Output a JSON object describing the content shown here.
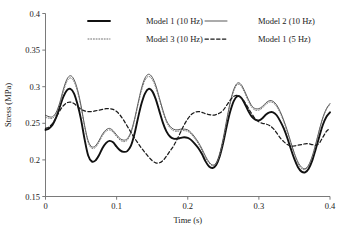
{
  "chart_data": {
    "type": "line",
    "title": "",
    "xlabel": "Time (s)",
    "ylabel": "Stress (MPa)",
    "xlim": [
      0,
      0.4
    ],
    "ylim": [
      0.15,
      0.4
    ],
    "xticks": [
      "0",
      "0.1",
      "0.2",
      "0.3",
      "0.4"
    ],
    "xtick_values": [
      0,
      0.1,
      0.2,
      0.3,
      0.4
    ],
    "yticks": [
      "0.15",
      "0.2",
      "0.25",
      "0.3",
      "0.35",
      "0.4"
    ],
    "ytick_values": [
      0.15,
      0.2,
      0.25,
      0.3,
      0.35,
      0.4
    ],
    "grid": false,
    "legend_position": "top-inside",
    "x": [
      0,
      0.005,
      0.01,
      0.015,
      0.02,
      0.025,
      0.03,
      0.035,
      0.04,
      0.045,
      0.05,
      0.055,
      0.06,
      0.065,
      0.07,
      0.075,
      0.08,
      0.085,
      0.09,
      0.095,
      0.1,
      0.105,
      0.11,
      0.115,
      0.12,
      0.125,
      0.13,
      0.135,
      0.14,
      0.145,
      0.15,
      0.155,
      0.16,
      0.165,
      0.17,
      0.175,
      0.18,
      0.185,
      0.19,
      0.195,
      0.2,
      0.205,
      0.21,
      0.215,
      0.22,
      0.225,
      0.23,
      0.235,
      0.24,
      0.245,
      0.25,
      0.255,
      0.26,
      0.265,
      0.27,
      0.275,
      0.28,
      0.285,
      0.29,
      0.295,
      0.3,
      0.305,
      0.31,
      0.315,
      0.32,
      0.325,
      0.33,
      0.335,
      0.34,
      0.345,
      0.35,
      0.355,
      0.36,
      0.365,
      0.37,
      0.375,
      0.38,
      0.385,
      0.39,
      0.395,
      0.4
    ],
    "series": [
      {
        "name": "Model 1 (10 Hz)",
        "style": "solid-thick",
        "color": "#111111",
        "width": 1.9,
        "values": [
          0.241,
          0.243,
          0.248,
          0.258,
          0.272,
          0.286,
          0.295,
          0.297,
          0.291,
          0.276,
          0.255,
          0.228,
          0.206,
          0.198,
          0.199,
          0.206,
          0.216,
          0.223,
          0.226,
          0.224,
          0.218,
          0.213,
          0.211,
          0.212,
          0.219,
          0.235,
          0.257,
          0.277,
          0.291,
          0.297,
          0.294,
          0.283,
          0.267,
          0.251,
          0.239,
          0.232,
          0.229,
          0.229,
          0.23,
          0.231,
          0.23,
          0.227,
          0.222,
          0.216,
          0.208,
          0.198,
          0.191,
          0.189,
          0.193,
          0.205,
          0.224,
          0.247,
          0.267,
          0.281,
          0.287,
          0.285,
          0.277,
          0.267,
          0.259,
          0.255,
          0.254,
          0.257,
          0.262,
          0.265,
          0.265,
          0.261,
          0.253,
          0.243,
          0.23,
          0.215,
          0.201,
          0.19,
          0.184,
          0.183,
          0.188,
          0.199,
          0.215,
          0.232,
          0.248,
          0.259,
          0.265
        ]
      },
      {
        "name": "Model 2 (10 Hz)",
        "style": "solid-thin",
        "color": "#3a3a3a",
        "width": 0.85,
        "values": [
          0.261,
          0.259,
          0.259,
          0.265,
          0.278,
          0.296,
          0.31,
          0.315,
          0.31,
          0.296,
          0.274,
          0.247,
          0.226,
          0.218,
          0.219,
          0.226,
          0.235,
          0.241,
          0.243,
          0.24,
          0.234,
          0.229,
          0.227,
          0.229,
          0.238,
          0.255,
          0.277,
          0.298,
          0.312,
          0.317,
          0.313,
          0.302,
          0.285,
          0.268,
          0.254,
          0.246,
          0.242,
          0.241,
          0.242,
          0.242,
          0.241,
          0.237,
          0.231,
          0.224,
          0.215,
          0.205,
          0.197,
          0.193,
          0.196,
          0.209,
          0.23,
          0.256,
          0.28,
          0.297,
          0.305,
          0.303,
          0.294,
          0.283,
          0.274,
          0.27,
          0.27,
          0.273,
          0.278,
          0.281,
          0.28,
          0.275,
          0.266,
          0.254,
          0.24,
          0.224,
          0.209,
          0.197,
          0.19,
          0.188,
          0.193,
          0.205,
          0.222,
          0.241,
          0.258,
          0.27,
          0.277
        ]
      },
      {
        "name": "Model 3 (10 Hz)",
        "style": "dotted",
        "color": "#6e6e6e",
        "width": 1.0,
        "values": [
          0.258,
          0.257,
          0.257,
          0.263,
          0.276,
          0.293,
          0.307,
          0.312,
          0.307,
          0.293,
          0.272,
          0.245,
          0.224,
          0.216,
          0.217,
          0.224,
          0.233,
          0.239,
          0.241,
          0.238,
          0.232,
          0.227,
          0.225,
          0.227,
          0.236,
          0.253,
          0.275,
          0.295,
          0.309,
          0.314,
          0.31,
          0.299,
          0.283,
          0.266,
          0.252,
          0.244,
          0.24,
          0.239,
          0.24,
          0.24,
          0.239,
          0.235,
          0.229,
          0.222,
          0.213,
          0.203,
          0.196,
          0.192,
          0.195,
          0.207,
          0.228,
          0.254,
          0.278,
          0.295,
          0.303,
          0.301,
          0.292,
          0.281,
          0.272,
          0.268,
          0.268,
          0.271,
          0.276,
          0.279,
          0.278,
          0.273,
          0.264,
          0.252,
          0.238,
          0.222,
          0.207,
          0.195,
          0.188,
          0.187,
          0.192,
          0.204,
          0.221,
          0.24,
          0.257,
          0.269,
          0.276
        ]
      },
      {
        "name": "Model 1 (5 Hz)",
        "style": "dashed",
        "color": "#1a1a1a",
        "width": 1.25,
        "values": [
          0.243,
          0.245,
          0.25,
          0.258,
          0.267,
          0.274,
          0.278,
          0.279,
          0.277,
          0.273,
          0.269,
          0.267,
          0.266,
          0.266,
          0.267,
          0.268,
          0.269,
          0.27,
          0.27,
          0.269,
          0.266,
          0.261,
          0.254,
          0.246,
          0.238,
          0.23,
          0.223,
          0.216,
          0.21,
          0.204,
          0.199,
          0.196,
          0.196,
          0.199,
          0.205,
          0.212,
          0.219,
          0.228,
          0.238,
          0.248,
          0.256,
          0.262,
          0.265,
          0.266,
          0.265,
          0.263,
          0.262,
          0.261,
          0.262,
          0.264,
          0.268,
          0.275,
          0.282,
          0.287,
          0.288,
          0.285,
          0.279,
          0.271,
          0.263,
          0.256,
          0.252,
          0.25,
          0.249,
          0.247,
          0.243,
          0.237,
          0.23,
          0.225,
          0.221,
          0.219,
          0.219,
          0.22,
          0.221,
          0.222,
          0.222,
          0.221,
          0.22,
          0.223,
          0.231,
          0.239,
          0.243
        ]
      }
    ],
    "legend": [
      {
        "label": "Model 1 (10 Hz)",
        "style": "solid-thick"
      },
      {
        "label": "Model 2 (10 Hz)",
        "style": "solid-thin"
      },
      {
        "label": "Model 3 (10 Hz)",
        "style": "dotted"
      },
      {
        "label": "Model 1 (5 Hz)",
        "style": "dashed"
      }
    ]
  }
}
